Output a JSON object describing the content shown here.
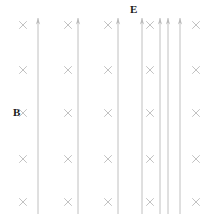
{
  "figure": {
    "type": "physics-field-diagram",
    "background_color": "#ffffff",
    "field_line_color": "#b9b9b9",
    "cross_color": "#c2c2c2",
    "label_color": "#1a1a1a",
    "width": 210,
    "height": 220,
    "labels": [
      {
        "text": "E",
        "name": "electric-field-label",
        "x": 130,
        "y": 4
      },
      {
        "text": "B",
        "name": "magnetic-field-label",
        "x": 13,
        "y": 107
      }
    ],
    "field_lines": {
      "name": "electric-field-lines",
      "direction": "up",
      "count": 7,
      "x_positions": [
        38,
        78,
        118,
        142,
        160,
        168,
        180
      ],
      "y_top": 18,
      "y_bottom": 214,
      "arrowhead": "up"
    },
    "crosses": {
      "name": "magnetic-field-crosses",
      "symbol": "×",
      "meaning": "into-page",
      "columns": [
        23,
        68,
        108,
        150,
        196
      ],
      "rows": [
        25,
        70,
        113,
        159,
        202
      ],
      "size": 7
    }
  }
}
